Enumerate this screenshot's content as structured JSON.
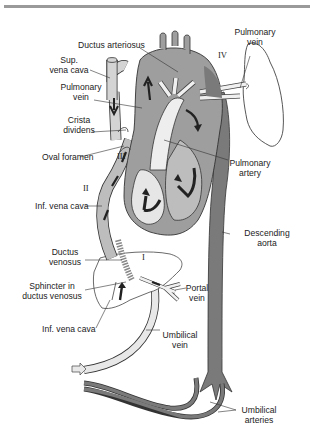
{
  "figure": {
    "colors": {
      "oxygenated": "#f2f2f2",
      "mixed": "#bdbdbd",
      "deoxygenated": "#7a7a7a",
      "heart_wall": "#9e9e9e",
      "outline": "#333333",
      "divider": "#9a9a9a"
    },
    "labels": {
      "ductus_arteriosus": "Ductus arteriosus",
      "pulmonary_vein_right_1": "Pulmonary",
      "pulmonary_vein_right_2": "vein",
      "sup_vena_cava_1": "Sup.",
      "sup_vena_cava_2": "vena cava",
      "pulmonary_vein_left_1": "Pulmonary",
      "pulmonary_vein_left_2": "vein",
      "crista_dividens_1": "Crista",
      "crista_dividens_2": "dividens",
      "oval_foramen": "Oval foramen",
      "pulmonary_artery_1": "Pulmonary",
      "pulmonary_artery_2": "artery",
      "inf_vena_cava_upper": "Inf. vena cava",
      "descending_aorta_1": "Descending",
      "descending_aorta_2": "aorta",
      "ductus_venosus_1": "Ductus",
      "ductus_venosus_2": "venosus",
      "sphincter_1": "Sphincter in",
      "sphincter_2": "ductus venosus",
      "portal_vein_1": "Portal",
      "portal_vein_2": "vein",
      "inf_vena_cava_lower": "Inf. vena cava",
      "umbilical_vein_1": "Umbilical",
      "umbilical_vein_2": "vein",
      "umbilical_arteries_1": "Umbilical",
      "umbilical_arteries_2": "arteries"
    },
    "roman_numerals": {
      "i": "I",
      "ii": "II",
      "iii": "III",
      "iv": "IV"
    }
  }
}
